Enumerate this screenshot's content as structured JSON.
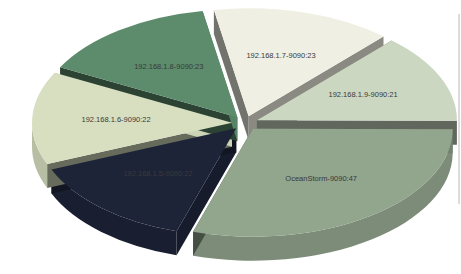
{
  "page": {
    "background": "#ffffff"
  },
  "chart_data": {
    "type": "pie",
    "style": "3d-exploded",
    "title": "",
    "legend": "none",
    "grid": false,
    "start_angle_deg": 100,
    "direction": "clockwise",
    "depth_px": 24,
    "explode_px": 13,
    "label_color": "#3a3a3a",
    "total": 158,
    "slices": [
      {
        "label": "192.168.1.7-9090:23",
        "name": "192.168.1.7-9090",
        "value": 23,
        "color": "#efefe3"
      },
      {
        "label": "192.168.1.9-9090:21",
        "name": "192.168.1.9-9090",
        "value": 21,
        "color": "#ccd7c1"
      },
      {
        "label": "OceanStorm-9090:47",
        "name": "OceanStorm-9090",
        "value": 47,
        "color": "#92a58d"
      },
      {
        "label": "192.168.1.5-9090:22",
        "name": "192.168.1.5-9090",
        "value": 22,
        "color": "#1d2438"
      },
      {
        "label": "192.168.1.6-9090:22",
        "name": "192.168.1.6-9090",
        "value": 22,
        "color": "#d7dfc0"
      },
      {
        "label": "192.168.1.8-9090:23",
        "name": "192.168.1.8-9090",
        "value": 23,
        "color": "#5c8c6c"
      }
    ]
  }
}
